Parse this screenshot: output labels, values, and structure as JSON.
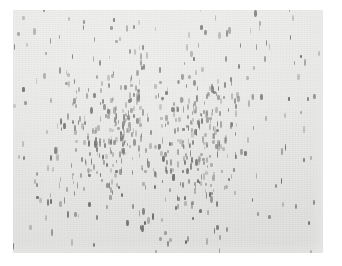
{
  "figure": {
    "name": "scatter-density-plot",
    "caption": "",
    "background_color": "#e9e9e7",
    "page_color": "#ffffff",
    "mark_color": "#5e5e5e",
    "mark_shape": "vertical-dash",
    "frame": {
      "x": 13,
      "y": 10,
      "width": 310,
      "height": 243
    }
  },
  "chart_data": {
    "type": "scatter",
    "title": "",
    "subtitle": "",
    "xlabel": "",
    "ylabel": "",
    "xlim": [
      0,
      100
    ],
    "ylim": [
      0,
      100
    ],
    "grid": false,
    "legend": null,
    "annotations": [],
    "xticklabels": [],
    "yticklabels": [],
    "density_model": {
      "total_points": 620,
      "background_uniform_points": 210,
      "clusters": [
        {
          "name": "left-lobe",
          "cx": 33,
          "cy": 50,
          "sx": 9.0,
          "sy": 15.0,
          "points": 205
        },
        {
          "name": "right-lobe",
          "cx": 60,
          "cy": 52,
          "sx": 7.5,
          "sy": 16.0,
          "points": 205
        }
      ],
      "mark_width_px": [
        1,
        3
      ],
      "mark_height_px": [
        3,
        7
      ],
      "mark_opacity_range": [
        0.28,
        0.95
      ]
    }
  }
}
